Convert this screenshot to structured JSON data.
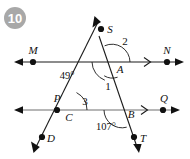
{
  "badge": {
    "label": "10",
    "fill_color": "#a8a8a8",
    "text_color": "#ffffff"
  },
  "colors": {
    "line": "#1a1a1a",
    "line_parallel_lower": "#6e6e6e",
    "text": "#111111",
    "background": "#ffffff"
  },
  "diagram": {
    "type": "two-parallel-lines-cut-by-two-transversals",
    "points": [
      {
        "name": "M",
        "label": "M",
        "x": 33,
        "y": 62,
        "label_x": 33,
        "label_y": 54,
        "dot": true
      },
      {
        "name": "N",
        "label": "N",
        "x": 167,
        "y": 62,
        "label_x": 167,
        "label_y": 54,
        "dot": true
      },
      {
        "name": "P",
        "label": "P",
        "x": 57,
        "y": 110,
        "label_x": 57,
        "label_y": 102,
        "dot": true
      },
      {
        "name": "Q",
        "label": "Q",
        "x": 163,
        "y": 110,
        "label_x": 164,
        "label_y": 102,
        "dot": true
      },
      {
        "name": "S",
        "label": "S",
        "x": 101,
        "y": 29,
        "label_x": 110,
        "label_y": 31,
        "dot": true
      },
      {
        "name": "D",
        "label": "D",
        "x": 42,
        "y": 137,
        "label_x": 51,
        "label_y": 142,
        "dot": true
      },
      {
        "name": "T",
        "label": "T",
        "x": 134,
        "y": 137,
        "label_x": 143,
        "label_y": 142,
        "dot": true
      },
      {
        "name": "A",
        "label": "A",
        "x": 112,
        "y": 62,
        "label_x": 119,
        "label_y": 72,
        "dot": false
      },
      {
        "name": "C",
        "label": "C",
        "x": 67,
        "y": 110,
        "label_x": 69,
        "label_y": 120,
        "dot": false
      },
      {
        "name": "B",
        "label": "B",
        "x": 122,
        "y": 110,
        "label_x": 130,
        "label_y": 118,
        "dot": false
      }
    ],
    "lines": [
      {
        "name": "line-MN",
        "kind": "parallel-line",
        "from": "M-side",
        "tick_marks": 1
      },
      {
        "name": "line-PQ",
        "kind": "parallel-line",
        "from": "P-side",
        "tick_marks": 1
      },
      {
        "name": "transversal-SD",
        "kind": "transversal",
        "through": "S-A-C-D"
      },
      {
        "name": "transversal-AT",
        "kind": "transversal",
        "through": "A-B-T"
      }
    ],
    "angles": [
      {
        "name": "angle-49",
        "label": "49°",
        "vertex": "A",
        "x": 67,
        "y": 79,
        "arc": true
      },
      {
        "name": "angle-2",
        "label": "2",
        "vertex": "A",
        "x": 124,
        "y": 44,
        "arc": true
      },
      {
        "name": "angle-1",
        "label": "1",
        "vertex": "A",
        "x": 108,
        "y": 88,
        "arc": true
      },
      {
        "name": "angle-3",
        "label": "3",
        "vertex": "C",
        "x": 84,
        "y": 104,
        "arc": true
      },
      {
        "name": "angle-107",
        "label": "107°",
        "vertex": "B",
        "x": 105,
        "y": 128,
        "arc": true
      }
    ]
  }
}
